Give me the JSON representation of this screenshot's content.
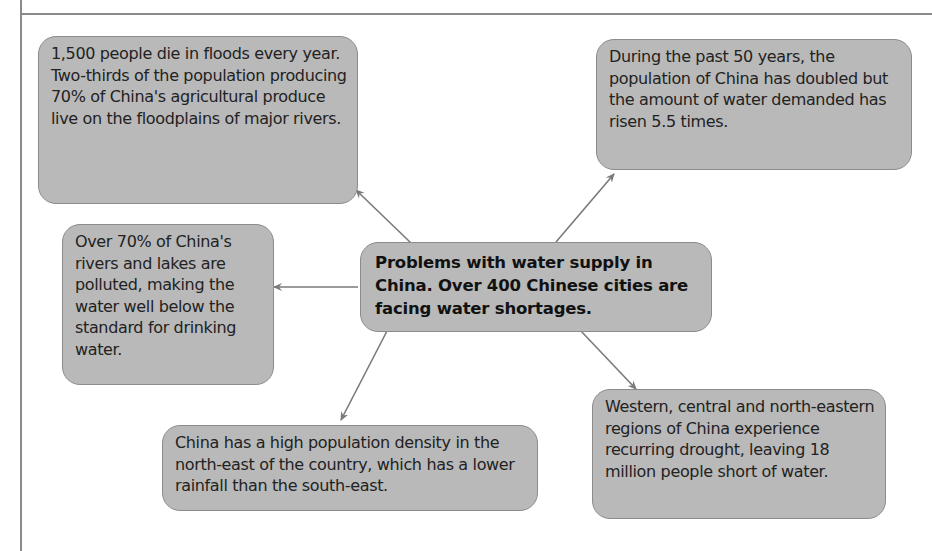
{
  "diagram": {
    "type": "mind-map",
    "center": {
      "text": "Problems with water supply in China. Over 400 Chinese cities are facing water shortages."
    },
    "nodes": [
      {
        "id": "floods",
        "position": "top-left",
        "text": "1,500 people die in floods every year. Two-thirds of the population producing 70% of China's agricultural produce live on the floodplains of major rivers."
      },
      {
        "id": "demand",
        "position": "top-right",
        "text": "During the past 50 years, the population of China has doubled but the amount of water demanded has risen 5.5 times."
      },
      {
        "id": "pollution",
        "position": "middle-left",
        "text": "Over 70% of China's rivers and lakes are polluted, making the water well below the standard for drinking water."
      },
      {
        "id": "population-density",
        "position": "bottom-center",
        "text": "China has a high population density in the north-east of the country, which has a lower rainfall than the south-east."
      },
      {
        "id": "drought",
        "position": "bottom-right",
        "text": "Western, central and north-eastern regions of China experience recurring drought, leaving 18 million people short of water."
      }
    ],
    "colors": {
      "node_fill": "#b9b9b9",
      "node_border": "#8c8c8c",
      "arrow": "#7a7a7a",
      "frame": "#8a8a8a"
    }
  }
}
